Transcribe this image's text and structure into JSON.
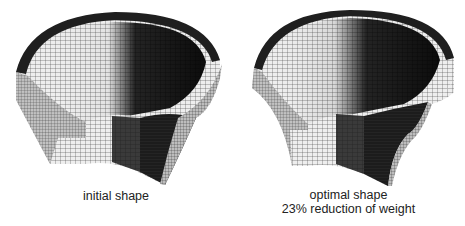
{
  "figures": [
    {
      "id": "initial",
      "caption_lines": [
        "initial shape"
      ],
      "description": "3D finite-element mesh of cut-away conical shell part (initial shape)"
    },
    {
      "id": "optimal",
      "caption_lines": [
        "optimal shape",
        "23% reduction of weight"
      ],
      "description": "3D finite-element mesh of cut-away conical shell part (optimized shape)"
    }
  ],
  "colors": {
    "background": "#ffffff",
    "mesh_light": "#e8e8e8",
    "mesh_mid": "#9a9a9a",
    "mesh_dark": "#1a1a1a",
    "grid_line": "#333333"
  }
}
